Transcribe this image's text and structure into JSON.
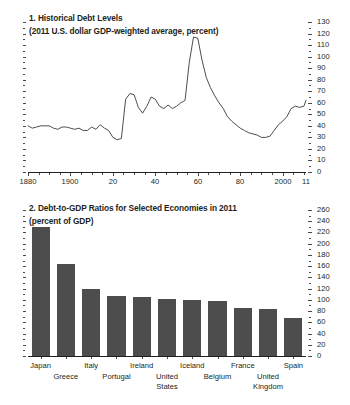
{
  "figure": {
    "panels": [
      {
        "number": "1.",
        "title": "1. Historical Debt Levels",
        "subtitle": "(2011 U.S. dollar GDP-weighted average, percent)"
      },
      {
        "number": "2.",
        "title": "2. Debt-to-GDP Ratios for Selected Economies in 2011",
        "subtitle": "(percent of GDP)"
      }
    ]
  },
  "chart_data": [
    {
      "type": "line",
      "title": "1. Historical Debt Levels",
      "subtitle": "(2011 U.S. dollar GDP-weighted average, percent)",
      "xlabel": "",
      "ylabel": "",
      "xlim": [
        1880,
        2011
      ],
      "ylim": [
        0,
        130
      ],
      "ytick_labels": [
        "0",
        "10",
        "20",
        "30",
        "40",
        "50",
        "60",
        "70",
        "80",
        "90",
        "100",
        "110",
        "120",
        "130"
      ],
      "ytick_values": [
        0,
        10,
        20,
        30,
        40,
        50,
        60,
        70,
        80,
        90,
        100,
        110,
        120,
        130
      ],
      "ytick_side": "right",
      "xtick_labels": [
        "1880",
        "1900",
        "20",
        "40",
        "60",
        "80",
        "2000",
        "11"
      ],
      "xtick_values": [
        1880,
        1900,
        1920,
        1940,
        1960,
        1980,
        2000,
        2011
      ],
      "grid": false,
      "legend": false,
      "x": [
        1880,
        1882,
        1884,
        1886,
        1888,
        1890,
        1892,
        1894,
        1896,
        1898,
        1900,
        1902,
        1904,
        1906,
        1908,
        1910,
        1912,
        1914,
        1916,
        1918,
        1920,
        1922,
        1924,
        1926,
        1928,
        1930,
        1932,
        1934,
        1936,
        1938,
        1940,
        1942,
        1944,
        1946,
        1948,
        1950,
        1952,
        1954,
        1956,
        1958,
        1960,
        1962,
        1964,
        1966,
        1968,
        1970,
        1972,
        1974,
        1976,
        1978,
        1980,
        1982,
        1984,
        1986,
        1988,
        1990,
        1992,
        1994,
        1996,
        1998,
        2000,
        2002,
        2004,
        2006,
        2008,
        2010,
        2011
      ],
      "y": [
        40,
        38,
        39,
        40,
        40,
        40,
        38,
        37,
        39,
        39,
        38,
        37,
        38,
        36,
        36,
        39,
        37,
        41,
        38,
        36,
        30,
        28,
        29,
        63,
        68,
        67,
        56,
        51,
        57,
        65,
        63,
        57,
        55,
        58,
        55,
        57,
        60,
        62,
        95,
        117,
        116,
        97,
        82,
        73,
        66,
        60,
        55,
        48,
        44,
        41,
        38,
        36,
        34,
        33,
        32,
        30,
        30,
        31,
        36,
        41,
        44,
        48,
        55,
        57,
        56,
        57,
        62,
        66,
        69,
        71,
        72,
        70,
        72,
        73,
        74,
        73,
        78,
        79,
        78,
        88,
        98,
        104
      ],
      "series_note": "Single series, GDP-weighted average advanced-economy debt, percent of GDP"
    },
    {
      "type": "bar",
      "title": "2. Debt-to-GDP Ratios for Selected Economies in 2011",
      "subtitle": "(percent of GDP)",
      "xlabel": "",
      "ylabel": "",
      "ylim": [
        0,
        260
      ],
      "ytick_labels": [
        "0",
        "20",
        "40",
        "60",
        "80",
        "100",
        "120",
        "140",
        "160",
        "180",
        "200",
        "220",
        "240",
        "260"
      ],
      "ytick_values": [
        0,
        20,
        40,
        60,
        80,
        100,
        120,
        140,
        160,
        180,
        200,
        220,
        240,
        260
      ],
      "ytick_side": "right",
      "grid": false,
      "legend": false,
      "categories": [
        "Japan",
        "Greece",
        "Italy",
        "Portugal",
        "Ireland",
        "United States",
        "Iceland",
        "Belgium",
        "France",
        "United Kingdom",
        "Spain"
      ],
      "category_rows": [
        0,
        1,
        0,
        1,
        0,
        1,
        0,
        1,
        0,
        1,
        0
      ],
      "category_lines": [
        [
          "Japan"
        ],
        [
          "Greece"
        ],
        [
          "Italy"
        ],
        [
          "Portugal"
        ],
        [
          "Ireland"
        ],
        [
          "United",
          "States"
        ],
        [
          "Iceland"
        ],
        [
          "Belgium"
        ],
        [
          "France"
        ],
        [
          "United",
          "Kingdom"
        ],
        [
          "Spain"
        ]
      ],
      "values": [
        230,
        163,
        120,
        107,
        105,
        102,
        99,
        98,
        86,
        83,
        68
      ],
      "bar_color": "#4d4d4d"
    }
  ]
}
